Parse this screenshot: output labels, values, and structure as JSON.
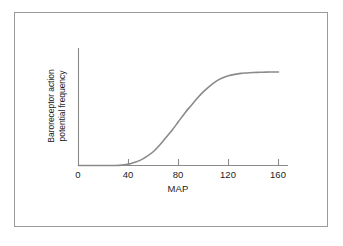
{
  "chart_data": {
    "type": "line",
    "title": "",
    "subtitle": "",
    "xlabel": "MAP",
    "ylabel": "Baroreceptor action potential frequency",
    "ylabel_line1": "Baroreceptor action",
    "ylabel_line2": "potential frequency",
    "xlim": [
      0,
      168
    ],
    "ylim": [
      0,
      1.12
    ],
    "xticks": [
      0,
      40,
      80,
      120,
      160
    ],
    "xtick_labels": [
      "0",
      "40",
      "80",
      "120",
      "160"
    ],
    "yticks": [],
    "ytick_labels": [],
    "grid": false,
    "legend": null,
    "legend_position": "none",
    "annotations": [],
    "series": [
      {
        "name": "Baroreceptor firing rate",
        "color": "#8a8a8a",
        "line_width": 1.6,
        "description": "Sigmoid curve: threshold near MAP 30, steep rise between MAP 50 and 110, midpoint (inflection) at MAP 90, saturation plateau from MAP 130 to 160",
        "x": [
          0,
          10,
          20,
          30,
          35,
          40,
          45,
          50,
          55,
          60,
          65,
          70,
          75,
          80,
          85,
          90,
          95,
          100,
          105,
          110,
          115,
          120,
          125,
          130,
          135,
          140,
          145,
          150,
          155,
          160
        ],
        "y": [
          0.0,
          0.0,
          0.0,
          0.0,
          0.005,
          0.015,
          0.035,
          0.06,
          0.1,
          0.15,
          0.22,
          0.3,
          0.38,
          0.47,
          0.56,
          0.64,
          0.72,
          0.79,
          0.85,
          0.9,
          0.935,
          0.96,
          0.975,
          0.985,
          0.99,
          0.995,
          0.997,
          0.999,
          1.0,
          1.0
        ]
      }
    ]
  },
  "axes": {
    "y_axis_visible": true,
    "x_axis_visible": true,
    "axis_color": "#8a8a8a"
  },
  "figure": {
    "border_color": "#9a9a9a",
    "background": "#ffffff"
  }
}
